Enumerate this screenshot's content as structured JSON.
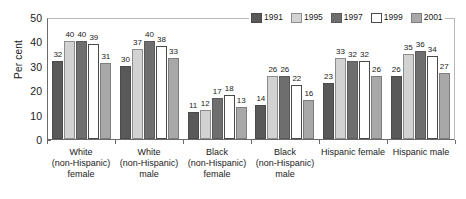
{
  "chart_data": {
    "type": "bar",
    "title": "",
    "xlabel": "",
    "ylabel": "Per cent",
    "ylim": [
      0,
      50
    ],
    "yticks": [
      0,
      10,
      20,
      30,
      40,
      50
    ],
    "grid": false,
    "legend_position": "top-right",
    "categories": [
      [
        "White",
        "(non-Hispanic)",
        "female"
      ],
      [
        "White",
        "(non-Hispanic)",
        "male"
      ],
      [
        "Black",
        "(non-Hispanic)",
        "female"
      ],
      [
        "Black",
        "(non-Hispanic)",
        "male"
      ],
      [
        "Hispanic female"
      ],
      [
        "Hispanic male"
      ]
    ],
    "series": [
      {
        "name": "1991",
        "color": "#595959",
        "values": [
          32,
          30,
          11,
          14,
          23,
          26
        ]
      },
      {
        "name": "1995",
        "color": "#d2d2d2",
        "values": [
          40,
          37,
          12,
          26,
          33,
          35
        ]
      },
      {
        "name": "1997",
        "color": "#6e6e6e",
        "values": [
          40,
          40,
          17,
          26,
          32,
          36
        ]
      },
      {
        "name": "1999",
        "color": "#ffffff",
        "values": [
          39,
          38,
          18,
          22,
          32,
          34
        ]
      },
      {
        "name": "2001",
        "color": "#a8a8a8",
        "values": [
          31,
          33,
          13,
          16,
          26,
          27
        ]
      }
    ]
  }
}
